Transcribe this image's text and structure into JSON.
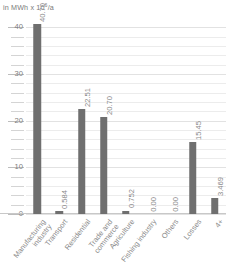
{
  "chart_data": {
    "type": "bar",
    "title": "",
    "subtitle": "",
    "axis_title": "in MWh x 10",
    "axis_title_exponent": "6",
    "axis_title_suffix": "/a",
    "xlabel": "",
    "ylabel": "in MWh x 10⁶/a",
    "ylim": [
      0,
      42
    ],
    "ytick_values": [
      0,
      10,
      20,
      30,
      40
    ],
    "ytick_labels": [
      "0",
      "10",
      "20",
      "30",
      "40"
    ],
    "minor_tick_step": 2,
    "grid": true,
    "legend": "none",
    "bar_color": "#6f6f6f",
    "categories": [
      "Manufacturing\nindustry",
      "Transport",
      "Residential",
      "Trade and\ncommerce",
      "Agriculture",
      "Fishing industry",
      "Others",
      "Losses",
      "4+"
    ],
    "values": [
      40.7,
      0.584,
      22.51,
      20.7,
      0.752,
      0.0,
      0.0,
      15.45,
      3.469
    ],
    "value_labels": [
      "40.70",
      "0.584",
      "22.51",
      "20.70",
      "0.752",
      "0.00",
      "0.00",
      "15.45",
      "3.469"
    ]
  }
}
